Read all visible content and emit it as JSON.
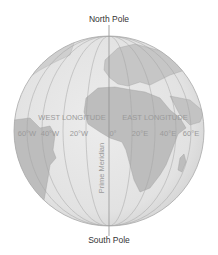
{
  "poles": {
    "north": "North Pole",
    "south": "South Pole"
  },
  "hemispheres": {
    "west": "WEST LONGITUDE",
    "east": "EAST LONGITUDE"
  },
  "meridian_label": "Prime Meridian",
  "longitude_ticks": {
    "w60": "60°W",
    "w40": "40°W",
    "w20": "20°W",
    "zero": "0°",
    "e20": "20°E",
    "e40": "40°E",
    "e60": "60°E"
  },
  "colors": {
    "ocean": "#e6e6e6",
    "land": "#bdbdbd",
    "lines": "#9e9e9e",
    "outline": "#a8a8a8"
  }
}
